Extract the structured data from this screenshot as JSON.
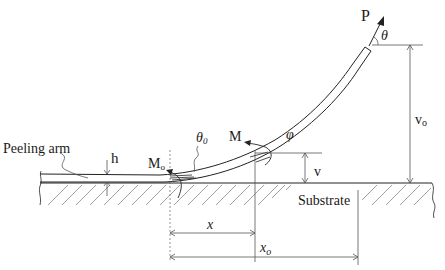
{
  "diagram": {
    "type": "peel-test-schematic",
    "labels": {
      "force": "P",
      "peel_angle": "θ",
      "vertical_offset_total": "v",
      "vertical_offset_total_sub": "o",
      "moment": "M",
      "slope_angle": "φ",
      "vertical_offset": "v",
      "peeling_arm": "Peeling arm",
      "thickness": "h",
      "root_moment": "M",
      "root_moment_sub": "o",
      "root_angle": "θ",
      "root_angle_sub": "0",
      "substrate": "Substrate",
      "horizontal_distance": "x",
      "horizontal_distance_total": "x",
      "horizontal_distance_total_sub": "o"
    },
    "colors": {
      "line": "#222222",
      "hatch": "#888888",
      "dimension": "#555555",
      "background": "#ffffff"
    }
  }
}
